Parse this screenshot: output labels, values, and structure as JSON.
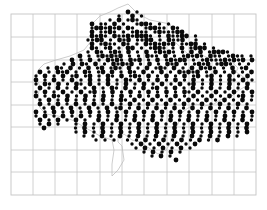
{
  "map": {
    "type": "dot-distribution-map",
    "background": "#ffffff",
    "dot_color": "#0a0a0a",
    "grid_color": "#c4c4c4",
    "frame": {
      "x": 11,
      "y": 14,
      "width": 245,
      "height": 181
    },
    "grid": {
      "vertical_lines_x": [
        33,
        55,
        77,
        100,
        122,
        144,
        167,
        189,
        212,
        234
      ],
      "horizontal_lines_y": [
        37,
        60,
        82,
        105,
        127,
        150,
        172
      ]
    },
    "dot_lattice": {
      "spacing": 4.5,
      "radius_by_code": {
        "1": 1.1,
        "2": 1.7,
        "3": 2.4
      }
    },
    "dot_rows": [
      {
        "y": 4,
        "x0": 128,
        "codes": "3.2"
      },
      {
        "y": 8,
        "x0": 119,
        "codes": "2..3.2"
      },
      {
        "y": 12,
        "x0": 110,
        "codes": "2.3.232"
      },
      {
        "y": 16,
        "x0": 92,
        "codes": "3.22.3.2..2332.2.2"
      },
      {
        "y": 20,
        "x0": 92,
        "codes": "2332323.32..23322.32"
      },
      {
        "y": 24,
        "x0": 92,
        "codes": "3.2232.2.2322.2322233"
      },
      {
        "y": 28,
        "x0": 92,
        "codes": "3232.322323332.2.32233.2"
      },
      {
        "y": 32,
        "x0": 88,
        "codes": "2233.2.323.2233.2.3223..2"
      },
      {
        "y": 36,
        "x0": 92,
        "codes": "3.2322.32.2.3232323.2233.2"
      },
      {
        "y": 40,
        "x0": 92,
        "codes": "32.23.2.33.2.2332.2.3.2333.2"
      },
      {
        "y": 44,
        "x0": 88,
        "codes": "2.32.232.3.2.3.23232.2.3.3.23332"
      },
      {
        "y": 48,
        "x0": 80,
        "codes": "3.2.232323.2.2.322.3.2.23232.322.2322.2"
      },
      {
        "y": 52,
        "x0": 72,
        "codes": "3.2.3.2.3232.323.2.3.23233.2.2322232323.3222"
      },
      {
        "y": 56,
        "x0": 64,
        "codes": "2.3.32.3.2.32323.2.3.2.323.2.2323.2332.2.2.3.23.2"
      },
      {
        "y": 60,
        "x0": 48,
        "codes": "2.32.3.2.3.23.232.3.2.3.232.3.2.3.3232.2.3.23.2.3.2322"
      },
      {
        "y": 64,
        "x0": 40,
        "codes": "3.2.323.2.32.23.3.2.32.3.2.3.2.32323.2.3.2.3.2.3.2.32.332"
      },
      {
        "y": 68,
        "x0": 36,
        "codes": "2.3.2.3.23.23.2.32.3.232.3.2.3.2.3.23.23.2.3.2.3.23.2.3.232"
      },
      {
        "y": 72,
        "x0": 36,
        "codes": "3.2.3.2.3.2.3.2.3.2.32.3.2.3.2.3.2.3.2.3.2.32.3.2.3.2.3.2.3.2.32"
      },
      {
        "y": 76,
        "x0": 36,
        "codes": "2.32.3.2.32.3.2.3.2.3.2.3.2.3.2.3.23.2.3.2.3.2.3.2.3.2.3.2.3.23.2"
      },
      {
        "y": 80,
        "x0": 40,
        "codes": "3.2.3.2.3.2.3.2.32.3.2.3.23.2.3.2.3.2.3.2.3.2.3.2.3.2.3.2.32.3"
      },
      {
        "y": 84,
        "x0": 36,
        "codes": "2.3.2.3.2.3.23.2.3.2.3.2.3.2.3.2.32.3.2.3.2.3.2.3.2.3.2.3.2.3.2.3"
      },
      {
        "y": 88,
        "x0": 36,
        "codes": "3.2.32.3.2.3.2.3.2.3.2.3.2.3.2.3.2.3.2.3.2.3.23.2.3.2.3.2.3.2.3.2"
      },
      {
        "y": 92,
        "x0": 40,
        "codes": "2.3.2.3.2.3.2.3.2.32.3.2.3.2.3.2.3.2.3.2.3.2.3.2.3.2.3.2.3.2.32.33"
      },
      {
        "y": 96,
        "x0": 40,
        "codes": "3.2.3.2.3.2.3.2.3.2.3.2.3.2.3.2.3.2.3.2.3.2.3.2.3.2.3.2.3.2.3.2.3.3"
      },
      {
        "y": 100,
        "x0": 44,
        "codes": "2.3.2.3.2.3.2.3.23.2.3.2.3.2.3.2.3.2.3.2.3.2.3.2.3.2.3.2.3.2.3.3"
      },
      {
        "y": 104,
        "x0": 36,
        "codes": "3.2.3.2.3.2.3.2.3.2.3.2.3.2.3.2.3.2.3.2.3.2.3.2.3.2.3.2.3.2.3.2.3.23"
      },
      {
        "y": 108,
        "x0": 36,
        "codes": "2.3.2.3.2.3.2.3.2.3.2.3.2.3.2.3.2.3.2.3.2.3.2.3.2.3.2.3.2.3.2.3.23"
      },
      {
        "y": 112,
        "x0": 40,
        "codes": "3.2.3.2.3.2..3.2.3.2.3.2.3.2.3.2.3.2.3.2.3.2.3.2.3.2.3.2.3.2.3.2"
      },
      {
        "y": 116,
        "x0": 40,
        "codes": "2.3.2...2.3.2.3.2.3.2.3.2.3.2.3.2.3.2.3.2.3.2.3.2.3.2..2.2"
      },
      {
        "y": 120,
        "x0": 44,
        "codes": "3......2.3.2.3.2.3.2.3.2.3.2.3.2.3.2.3.2.3.2.3.2..2"
      },
      {
        "y": 124,
        "x0": 76,
        "codes": "2.3.2.3.2.3.2.3.2.3.2.3.2.3.2.3.2.3.2.3.2"
      },
      {
        "y": 128,
        "x0": 84,
        "codes": "2.2.3.2.3.2.3.2.3.2.3.2.3.2.3.2.3.2"
      },
      {
        "y": 132,
        "x0": 96,
        "codes": "2.2.2..2.2.3.2.3.2.3.2.3.2.3"
      },
      {
        "y": 136,
        "x0": 132,
        "codes": "2.3.2.3.2.3.2.3"
      },
      {
        "y": 140,
        "x0": 136,
        "codes": "2.3.2.3.2.3.2"
      },
      {
        "y": 144,
        "x0": 144,
        "codes": "2.3.2.3.2"
      },
      {
        "y": 148,
        "x0": 152,
        "codes": "2.3.2"
      },
      {
        "y": 152,
        "x0": 176,
        "codes": "3"
      }
    ],
    "outline_points": "128,4 138,14 150,20 170,24 175,42 190,56 200,54 212,60 220,64 232,62 238,68 236,72 248,80 246,86 236,92 232,96 220,100 214,104 204,106 196,104 188,108 180,114 178,124 172,134 170,144 166,150 158,154 152,150 140,142 132,140 124,134 118,136 118,142 122,146 124,160 118,170 112,176 112,164 114,150 112,140 100,136 86,128 72,120 58,116 46,114 40,108 38,96 40,86 36,78 38,70 44,64 56,60 70,56 84,50 92,40 92,24 100,16 110,12 118,8"
  }
}
